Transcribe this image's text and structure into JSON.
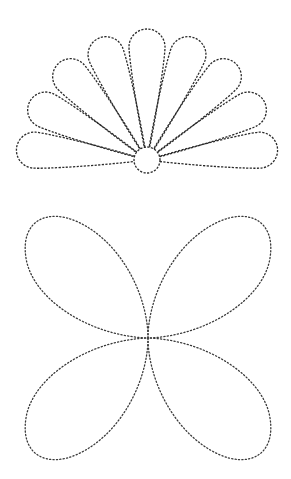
{
  "page": {
    "title": "Dotted tracing shapes",
    "background": "#ffffff"
  },
  "shapes": [
    {
      "id": "fan-flower",
      "label": "Fan flower with nine petals",
      "petal_count": 9,
      "line_style": "dashed",
      "stroke_color": "#2a2a2a",
      "has_center_circle": true
    },
    {
      "id": "four-petal-flower",
      "label": "Four-petal flower",
      "petal_count": 4,
      "line_style": "dotted",
      "stroke_color": "#3a3a3a",
      "has_center_circle": false
    }
  ]
}
